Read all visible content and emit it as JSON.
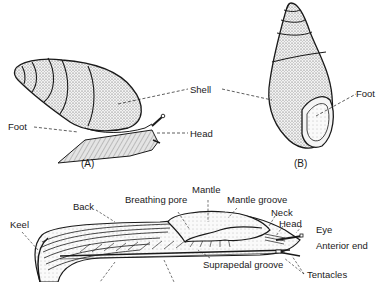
{
  "figure": {
    "panels": [
      {
        "id": "A",
        "caption": "(A)",
        "description": "Land snail with shell, side view",
        "labels": {
          "shell": "Shell",
          "foot": "Foot",
          "head": "Head"
        }
      },
      {
        "id": "B",
        "caption": "(B)",
        "description": "Snail retracted into shell, aperture view",
        "labels": {
          "shell": "Shell",
          "foot": "Foot"
        }
      },
      {
        "id": "C",
        "caption": "",
        "description": "Slug, side view",
        "labels": {
          "keel": "Keel",
          "back": "Back",
          "breathing_pore": "Breathing pore",
          "mantle": "Mantle",
          "mantle_groove": "Mantle groove",
          "neck": "Neck",
          "head": "Head",
          "eye": "Eye",
          "anterior_end": "Anterior end",
          "suprapedal_groove": "Suprapedal groove",
          "tentacles": "Tentacles"
        }
      }
    ],
    "colors": {
      "ink": "#1a1a1a",
      "stipple": "#d9d9d9",
      "background": "#ffffff"
    }
  }
}
